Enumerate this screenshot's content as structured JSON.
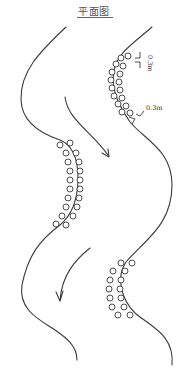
{
  "title": "平面图",
  "annotations": {
    "spacing_top": "0.3m",
    "spacing_side": "0.3m"
  },
  "elements": {
    "banks": [
      "left-bank",
      "right-bank"
    ],
    "pile_groups": [
      {
        "name": "upper-right-pile-group",
        "rows": 2
      },
      {
        "name": "middle-left-pile-group",
        "rows": 2
      },
      {
        "name": "lower-right-pile-group",
        "rows": 2
      }
    ],
    "flow_arrows": [
      "upper-flow-arrow",
      "lower-flow-arrow"
    ]
  },
  "colors": {
    "line": "#3a3a3a",
    "text": "#333333",
    "background": "#ffffff"
  }
}
